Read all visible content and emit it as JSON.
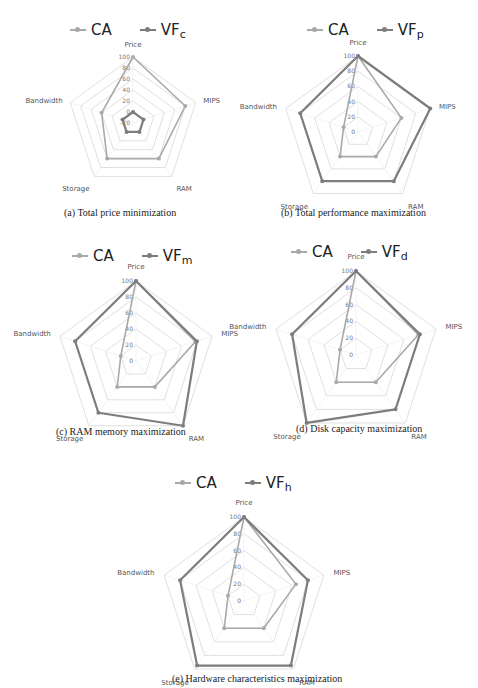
{
  "colors": {
    "CA": "#a9a9a9",
    "VF": "#7d7d7d",
    "grid": "#e0e0e0"
  },
  "chart_data": [
    {
      "id": "a",
      "type": "radar",
      "caption": "(a) Total price minimization",
      "axes": [
        "Price",
        "MIPS",
        "RAM",
        "Storage",
        "Bandwidth"
      ],
      "rlim": [
        -20,
        100
      ],
      "ticks": [
        -20,
        0,
        20,
        40,
        60,
        80,
        100
      ],
      "tick_labels": [
        "-20",
        "0",
        "20",
        "40",
        "60",
        "80",
        "100"
      ],
      "legend_placement": "top",
      "series": [
        {
          "name": "CA",
          "sub": "",
          "values": [
            100,
            80,
            60,
            60,
            40
          ]
        },
        {
          "name": "VF",
          "sub": "c",
          "values": [
            0,
            0,
            0,
            0,
            0
          ]
        }
      ]
    },
    {
      "id": "b",
      "type": "radar",
      "caption": "(b) Total performance maximization",
      "axes": [
        "Price",
        "MIPS",
        "RAM",
        "Storage",
        "Bandwidth"
      ],
      "rlim": [
        0,
        100
      ],
      "ticks": [
        0,
        20,
        40,
        60,
        80,
        100
      ],
      "tick_labels": [
        "0",
        "20",
        "40",
        "60",
        "80",
        "100"
      ],
      "legend_placement": "top",
      "series": [
        {
          "name": "CA",
          "sub": "",
          "values": [
            100,
            60,
            40,
            40,
            20
          ]
        },
        {
          "name": "VF",
          "sub": "p",
          "values": [
            100,
            100,
            80,
            80,
            80
          ]
        }
      ]
    },
    {
      "id": "c",
      "type": "radar",
      "caption": "(c) RAM memory maximization",
      "axes": [
        "Price",
        "MIPS",
        "RAM",
        "Storage",
        "Bandwidth"
      ],
      "rlim": [
        0,
        100
      ],
      "ticks": [
        0,
        20,
        40,
        60,
        80,
        100
      ],
      "tick_labels": [
        "0",
        "20",
        "40",
        "60",
        "80",
        "100"
      ],
      "legend_placement": "top",
      "series": [
        {
          "name": "CA",
          "sub": "",
          "values": [
            100,
            78,
            40,
            40,
            20
          ]
        },
        {
          "name": "VF",
          "sub": "m",
          "values": [
            100,
            80,
            100,
            80,
            80
          ]
        }
      ]
    },
    {
      "id": "d",
      "type": "radar",
      "caption": "(d) Disk capacity maximization",
      "axes": [
        "Price",
        "MIPS",
        "RAM",
        "Storage",
        "Bandwidth"
      ],
      "rlim": [
        0,
        100
      ],
      "ticks": [
        0,
        20,
        40,
        60,
        80,
        100
      ],
      "tick_labels": [
        "0",
        "20",
        "40",
        "60",
        "80",
        "100"
      ],
      "legend_placement": "top",
      "series": [
        {
          "name": "CA",
          "sub": "",
          "values": [
            100,
            78,
            40,
            40,
            20
          ]
        },
        {
          "name": "VF",
          "sub": "d",
          "values": [
            100,
            80,
            80,
            100,
            80
          ]
        }
      ]
    },
    {
      "id": "e",
      "type": "radar",
      "caption": "(e) Hardware characteristics maximization",
      "axes": [
        "Price",
        "MIPS",
        "RAM",
        "Storage",
        "Bandwidth"
      ],
      "rlim": [
        0,
        100
      ],
      "ticks": [
        0,
        20,
        40,
        60,
        80,
        100
      ],
      "tick_labels": [
        "0",
        "20",
        "40",
        "60",
        "80",
        "100"
      ],
      "legend_placement": "top",
      "series": [
        {
          "name": "CA",
          "sub": "",
          "values": [
            100,
            65,
            40,
            40,
            20
          ]
        },
        {
          "name": "VF",
          "sub": "h",
          "values": [
            100,
            80,
            95,
            95,
            80
          ]
        }
      ]
    }
  ]
}
